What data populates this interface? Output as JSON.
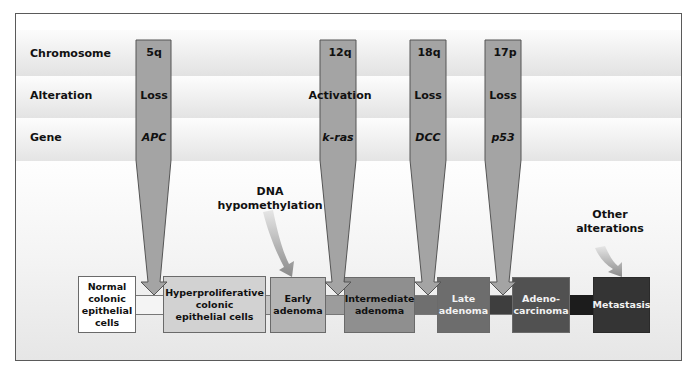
{
  "row_labels": {
    "chromosome": "Chromosome",
    "alteration": "Alteration",
    "gene": "Gene"
  },
  "events": [
    {
      "chromosome": "5q",
      "alteration": "Loss",
      "gene": "APC"
    },
    {
      "chromosome": "12q",
      "alteration": "Activation",
      "gene": "k-ras"
    },
    {
      "chromosome": "18q",
      "alteration": "Loss",
      "gene": "DCC"
    },
    {
      "chromosome": "17p",
      "alteration": "Loss",
      "gene": "p53"
    }
  ],
  "notes": {
    "dna": {
      "line1": "DNA",
      "line2": "hypomethylation"
    },
    "other": {
      "line1": "Other",
      "line2": "alterations"
    }
  },
  "stages": [
    {
      "lines": [
        "Normal",
        "colonic",
        "epithelial",
        "cells"
      ],
      "color": "#ffffff"
    },
    {
      "lines": [
        "Hyperproliferative",
        "colonic",
        "epithelial cells"
      ],
      "color": "#d2d2d2"
    },
    {
      "lines": [
        "Early",
        "adenoma"
      ],
      "color": "#b4b4b4"
    },
    {
      "lines": [
        "Intermediate",
        "adenoma"
      ],
      "color": "#8f8f8f"
    },
    {
      "lines": [
        "Late",
        "adenoma"
      ],
      "color": "#6d6d6d"
    },
    {
      "lines": [
        "Adeno-",
        "carcinoma"
      ],
      "color": "#515151"
    },
    {
      "lines": [
        "Metastasis"
      ],
      "color": "#343434"
    }
  ],
  "colors": {
    "bar_fill": "#a4a4a4",
    "bar_stroke": "#555555"
  }
}
